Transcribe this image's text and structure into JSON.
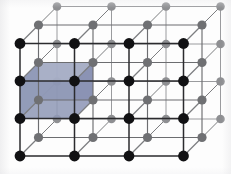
{
  "figure": {
    "background_color": "#fdfdfd",
    "width": 231,
    "height": 174
  },
  "lattice": {
    "type": "simple-cubic",
    "projection": "oblique",
    "grid": {
      "columns": 4,
      "rows": 4,
      "layers": 3
    },
    "origin": {
      "x": 20,
      "y": 156
    },
    "step_x": 54.5,
    "step_y": -37.5,
    "depth_offset": {
      "dx": 18.5,
      "dy": -18.5
    },
    "front_layer_index": 0,
    "node_radius_front": 5.4,
    "node_radius_back": 4.6,
    "colors": {
      "front_node": "#111113",
      "back_node_near": "#6f7073",
      "back_node_far": "#8e8f92",
      "front_edge": "#2b2b2e",
      "mid_edge": "#6c6d70",
      "far_edge": "#9a9b9e",
      "depth_edge": "#7c7d80",
      "cell_face_front": "#8f98b6",
      "cell_face_top": "#a8b0c6",
      "cell_face_side": "#7e87a6",
      "cell_outline": "#5d6party"
    }
  },
  "unit_cell": {
    "label": "highlighted unit cell",
    "column_index": 0,
    "row_index": 1,
    "layer_index": 0,
    "fill_front": "#8f98b6",
    "fill_top": "#aab2c8",
    "fill_side": "#848db0",
    "opacity": 0.82
  },
  "legend": {
    "front_node_label": "lattice point (front plane)",
    "back_node_label": "lattice point (rear planes)",
    "cell_label": "unit cell"
  }
}
